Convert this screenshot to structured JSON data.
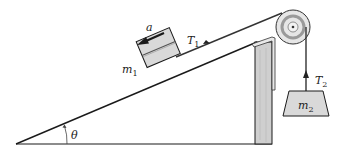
{
  "diagram": {
    "labels": {
      "acceleration": "a",
      "mass1": "m",
      "mass1_sub": "1",
      "tension1": "T",
      "tension1_sub": "1",
      "tension2": "T",
      "tension2_sub": "2",
      "mass2": "m",
      "mass2_sub": "2",
      "angle": "θ"
    },
    "colors": {
      "line": "#1a1a1a",
      "block_fill": "#d9d9d9",
      "post_fill": "#cfcfcf",
      "pulley_fill": "#e6e6e6",
      "pulley_ring": "#9a9a9a",
      "label": "#222222"
    }
  }
}
